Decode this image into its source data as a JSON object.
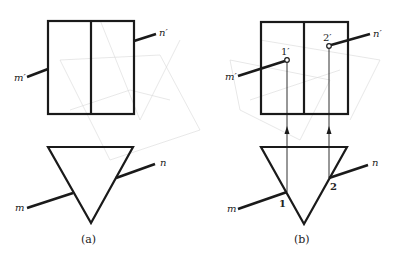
{
  "figure": {
    "panel_a": {
      "caption": "(a)",
      "front_view": {
        "label_m": "m′",
        "label_n": "n′"
      },
      "top_view": {
        "label_m": "m",
        "label_n": "n"
      }
    },
    "panel_b": {
      "caption": "(b)",
      "front_view": {
        "label_m": "m′",
        "label_n": "n′",
        "point_1": "1′",
        "point_2": "2′"
      },
      "top_view": {
        "label_m": "m",
        "label_n": "n",
        "point_1": "1",
        "point_2": "2"
      }
    },
    "colors": {
      "line": "#1a1a1a",
      "background": "#ffffff",
      "watermark": "#d8d8d8"
    }
  }
}
